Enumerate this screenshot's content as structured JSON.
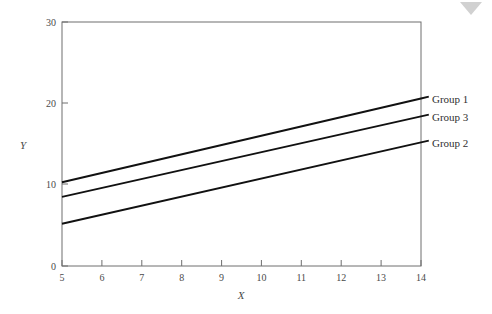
{
  "chart_data": {
    "type": "line",
    "title": "",
    "subtitle": "",
    "xlabel": "X",
    "ylabel": "Y",
    "xlim": [
      5,
      14
    ],
    "ylim": [
      0,
      30
    ],
    "x_ticks": [
      "5",
      "6",
      "7",
      "8",
      "9",
      "10",
      "11",
      "12",
      "13",
      "14"
    ],
    "x_tick_values": [
      5,
      6,
      7,
      8,
      9,
      10,
      11,
      12,
      13,
      14
    ],
    "y_ticks": [
      "0",
      "10",
      "20",
      "30"
    ],
    "y_tick_values": [
      0,
      10,
      20,
      30
    ],
    "grid": false,
    "legend_position": "right-inline-labels",
    "series": [
      {
        "name": "Group 1",
        "label": "Group 1",
        "color": "#111111",
        "x": [
          5,
          14
        ],
        "values": [
          10.3,
          20.6
        ]
      },
      {
        "name": "Group 3",
        "label": "Group 3",
        "color": "#111111",
        "x": [
          5,
          14
        ],
        "values": [
          8.5,
          18.4
        ]
      },
      {
        "name": "Group 2",
        "label": "Group 2",
        "color": "#111111",
        "x": [
          5,
          14
        ],
        "values": [
          5.2,
          15.2
        ]
      }
    ],
    "annotations": []
  },
  "axes": {
    "y_label": "Y",
    "x_label": "X",
    "y_tick_0": "0",
    "y_tick_10": "10",
    "y_tick_20": "20",
    "y_tick_30": "30",
    "x_tick_5": "5",
    "x_tick_6": "6",
    "x_tick_7": "7",
    "x_tick_8": "8",
    "x_tick_9": "9",
    "x_tick_10": "10",
    "x_tick_11": "11",
    "x_tick_12": "12",
    "x_tick_13": "13",
    "x_tick_14": "14"
  },
  "legend": {
    "item_1": "Group 1",
    "item_2": "Group 3",
    "item_3": "Group 2"
  },
  "colors": {
    "line": "#111111",
    "frame": "#6e6e6e",
    "text": "#3a3a3a",
    "background": "#ffffff",
    "artifact": "#c9c9c9"
  }
}
